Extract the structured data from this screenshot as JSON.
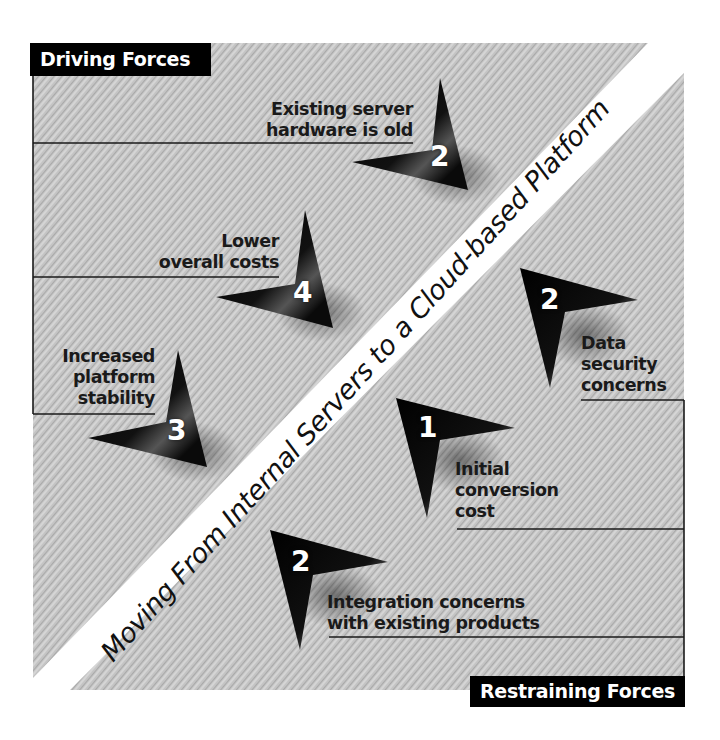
{
  "title": "Moving From Internal Servers to a Cloud-based Platform",
  "driving": {
    "label": "Driving Forces",
    "items": [
      {
        "text_line1": "Existing server",
        "text_line2": "hardware is old",
        "strength": "2"
      },
      {
        "text_line1": "Lower",
        "text_line2": "overall costs",
        "strength": "4"
      },
      {
        "text_line1": "Increased",
        "text_line2": "platform",
        "text_line3": "stability",
        "strength": "3"
      }
    ]
  },
  "restraining": {
    "label": "Restraining Forces",
    "items": [
      {
        "text_line1": "Data",
        "text_line2": "security",
        "text_line3": "concerns",
        "strength": "2"
      },
      {
        "text_line1": "Initial",
        "text_line2": "conversion",
        "text_line3": "cost",
        "strength": "1"
      },
      {
        "text_line1": "Integration concerns",
        "text_line2": "with existing products",
        "strength": "2"
      }
    ]
  },
  "colors": {
    "background_hatch": "#c8c8c8",
    "arrow": "#000000",
    "label_bg": "#000000",
    "label_text": "#ffffff",
    "divider_band": "#ffffff"
  }
}
